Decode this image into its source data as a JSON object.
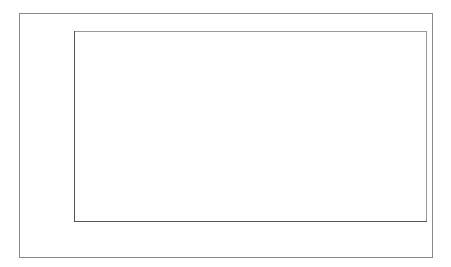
{
  "chart_data": {
    "type": "bar",
    "title": "",
    "xlabel": "",
    "ylabel": "Mean catastrophising steps",
    "categories": [
      "Positive mood",
      "Neutral mood",
      "Negative mood"
    ],
    "values": [
      3.75,
      3.53,
      6.24
    ],
    "ylim": [
      3,
      6.5
    ],
    "yticks": [
      "3",
      "3.5",
      "4",
      "4.5",
      "5",
      "5.5",
      "6",
      "6.5"
    ],
    "bar_color": "#141414",
    "grid": false,
    "legend": null
  }
}
